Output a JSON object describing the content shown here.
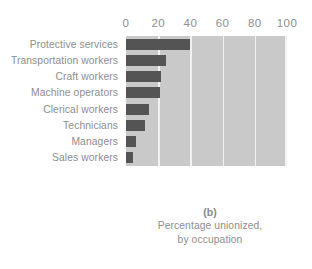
{
  "chart_data": {
    "type": "bar",
    "orientation": "horizontal",
    "title": "",
    "panel_label": "(b)",
    "caption_lines": [
      "Percentage unionized,",
      "by occupation"
    ],
    "xlabel": "",
    "ylabel": "",
    "xlim": [
      0,
      100
    ],
    "ylim": null,
    "grid": true,
    "grid_axis": "x",
    "axis_position": "top",
    "legend": null,
    "tick_labels": [
      "0",
      "20",
      "40",
      "60",
      "80",
      "100"
    ],
    "ticks": [
      0,
      20,
      40,
      60,
      80,
      100
    ],
    "categories": [
      "Protective services",
      "Transportation workers",
      "Craft workers",
      "Machine operators",
      "Clerical workers",
      "Technicians",
      "Managers",
      "Sales workers"
    ],
    "values": [
      40,
      25,
      22,
      21,
      14,
      12,
      6,
      4.5
    ],
    "colors": {
      "bar": "#545454",
      "plot_background": "#c9c9c9",
      "gridline": "#f2f2f2",
      "text": "#8e8e8e",
      "page_background": "#ffffff"
    }
  }
}
